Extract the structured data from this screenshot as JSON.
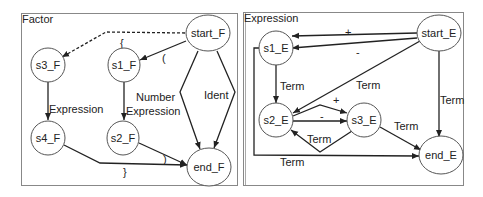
{
  "panels": [
    {
      "title": "Factor",
      "nodes": {
        "start": "start_F",
        "s1": "s1_F",
        "s2": "s2_F",
        "s3": "s3_F",
        "s4": "s4_F",
        "end": "end_F"
      },
      "edges": [
        {
          "from": "start_F",
          "to": "s3_F",
          "label": "(",
          "style": "dashed"
        },
        {
          "from": "start_F",
          "to": "s1_F",
          "label": "(",
          "style": "solid"
        },
        {
          "from": "s3_F",
          "to": "s4_F",
          "label": "Expression",
          "style": "solid"
        },
        {
          "from": "s1_F",
          "to": "s2_F",
          "label": "Expression",
          "style": "solid"
        },
        {
          "from": "start_F",
          "to": "end_F",
          "label": "Number",
          "style": "solid"
        },
        {
          "from": "start_F",
          "to": "end_F",
          "label": "Ident",
          "style": "solid"
        },
        {
          "from": "s2_F",
          "to": "end_F",
          "label": ")",
          "style": "solid"
        },
        {
          "from": "s4_F",
          "to": "end_F",
          "label": "}",
          "style": "solid"
        }
      ],
      "labels": {
        "dashed_brace": "{",
        "paren_open": "(",
        "number": "Number",
        "ident": "Ident",
        "expr_left": "Expression",
        "expr_mid": "Expression",
        "paren_close": ")",
        "brace_close": "}"
      }
    },
    {
      "title": "Expression",
      "nodes": {
        "start": "start_E",
        "s1": "s1_E",
        "s2": "s2_E",
        "s3": "s3_E",
        "end": "end_E"
      },
      "edges": [
        {
          "from": "start_E",
          "to": "s1_E",
          "label": "+"
        },
        {
          "from": "start_E",
          "to": "s1_E",
          "label": "-"
        },
        {
          "from": "s1_E",
          "to": "s2_E",
          "label": "Term"
        },
        {
          "from": "start_E",
          "to": "s2_E",
          "label": "Term"
        },
        {
          "from": "start_E",
          "to": "end_E",
          "label": "Term"
        },
        {
          "from": "s2_E",
          "to": "s3_E",
          "label": "+"
        },
        {
          "from": "s2_E",
          "to": "s3_E",
          "label": "-"
        },
        {
          "from": "s3_E",
          "to": "s2_E",
          "label": "Term"
        },
        {
          "from": "s3_E",
          "to": "end_E",
          "label": "Term"
        },
        {
          "from": "s1_E",
          "to": "end_E",
          "label": "Term"
        }
      ],
      "labels": {
        "plus_top": "+",
        "minus_top": "-",
        "term_s1_s2": "Term",
        "term_start_s2": "Term",
        "term_start_end": "Term",
        "plus_mid": "+",
        "minus_mid": "-",
        "term_s3_s2": "Term",
        "term_s3_end": "Term",
        "term_bottom": "Term"
      }
    }
  ]
}
